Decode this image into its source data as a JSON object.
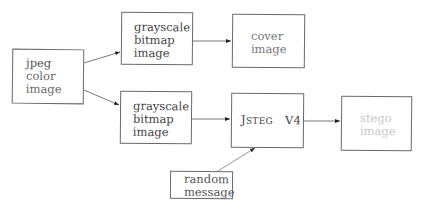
{
  "diagram": {
    "nodes": [
      {
        "id": "jpeg",
        "lines": [
          "jpeg",
          "color",
          "image"
        ]
      },
      {
        "id": "gray1",
        "lines": [
          "grayscale",
          "bitmap",
          "image"
        ]
      },
      {
        "id": "cover",
        "lines": [
          "cover",
          "image"
        ]
      },
      {
        "id": "gray2",
        "lines": [
          "grayscale",
          "bitmap",
          "image"
        ]
      },
      {
        "id": "jsteg",
        "lines": [
          "JSTEG V4"
        ],
        "name_first": "J",
        "name_rest": "STEG",
        "version": "V4"
      },
      {
        "id": "stego",
        "lines": [
          "stego",
          "image"
        ]
      },
      {
        "id": "random",
        "lines": [
          "random",
          "message"
        ]
      }
    ],
    "edges": [
      {
        "from": "jpeg",
        "to": "gray1"
      },
      {
        "from": "jpeg",
        "to": "gray2"
      },
      {
        "from": "gray1",
        "to": "cover"
      },
      {
        "from": "gray2",
        "to": "jsteg"
      },
      {
        "from": "jsteg",
        "to": "stego"
      },
      {
        "from": "random",
        "to": "jsteg"
      }
    ],
    "colors": {
      "border": "#6a6a6a",
      "arrow": "#333333",
      "text_dark": "#444444",
      "text_faded": "#c8c8c8"
    }
  }
}
